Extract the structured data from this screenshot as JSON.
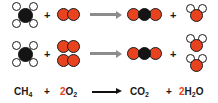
{
  "diagram": {
    "colors": {
      "oxygen": "#e8421f",
      "carbon": "#141414",
      "hydrogen": "#ffffff",
      "outline": "#1a1a1a",
      "arrow_molecular": "#8c8c8c",
      "arrow_formula": "#111111",
      "background": "#ffffff",
      "coefficient": "#e8421f"
    },
    "rows": [
      {
        "id": "molecular-unbalanced",
        "reactants": [
          {
            "name": "methane",
            "formula": "CH4",
            "count": 1
          },
          {
            "name": "dioxygen",
            "formula": "O2",
            "count": 1
          }
        ],
        "products": [
          {
            "name": "carbon dioxide",
            "formula": "CO2",
            "count": 1
          },
          {
            "name": "water",
            "formula": "H2O",
            "count": 1
          }
        ],
        "operator": "+",
        "arrow": "→"
      },
      {
        "id": "molecular-balanced",
        "reactants": [
          {
            "name": "methane",
            "formula": "CH4",
            "count": 1
          },
          {
            "name": "dioxygen",
            "formula": "O2",
            "count": 2
          }
        ],
        "products": [
          {
            "name": "carbon dioxide",
            "formula": "CO2",
            "count": 1
          },
          {
            "name": "water",
            "formula": "H2O",
            "count": 2
          }
        ],
        "operator": "+",
        "arrow": "→"
      }
    ],
    "formula": {
      "methane": {
        "coefficient": "",
        "symbol": "CH",
        "subscript": "4"
      },
      "plus_1": "+",
      "oxygen": {
        "coefficient": "2",
        "symbol": "O",
        "subscript": "2"
      },
      "arrow": "⟶",
      "carbon_dioxide": {
        "coefficient": "",
        "symbol": "CO",
        "subscript": "2"
      },
      "plus_2": "+",
      "water": {
        "coefficient": "2",
        "symbol": "H",
        "subscript": "2",
        "symbol_tail": "O"
      }
    }
  }
}
